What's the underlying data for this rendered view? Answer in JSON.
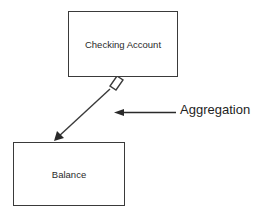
{
  "diagram": {
    "type": "uml-class-relationship",
    "relationship": "aggregation",
    "nodes": [
      {
        "id": "checking-account",
        "label": "Checking Account"
      },
      {
        "id": "balance",
        "label": "Balance"
      }
    ],
    "edges": [
      {
        "from": "checking-account",
        "to": "balance",
        "source_end": "hollow-diamond",
        "target_end": "filled-arrowhead"
      }
    ],
    "annotation": {
      "label": "Aggregation",
      "points_to": "aggregation-edge",
      "icon": "arrow-left-icon"
    },
    "colors": {
      "stroke": "#3a3a3a",
      "text": "#2a2a2a",
      "background": "#ffffff"
    }
  }
}
